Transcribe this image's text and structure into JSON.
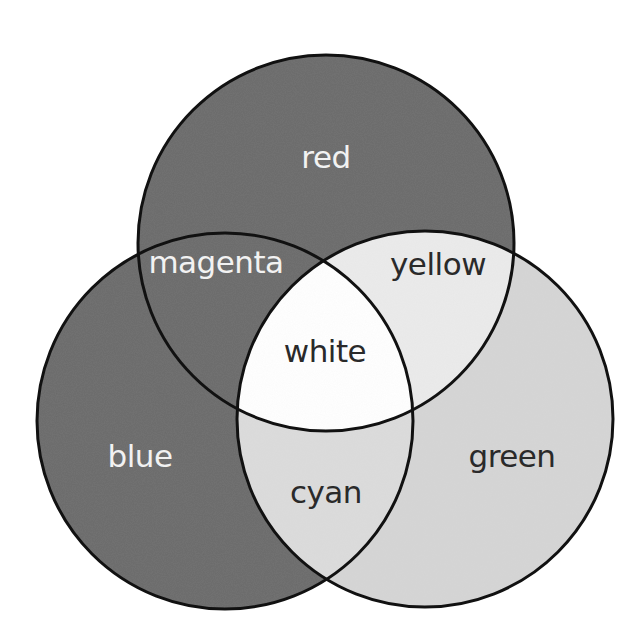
{
  "diagram": {
    "type": "venn",
    "title": "",
    "outline_color": "#111111",
    "sets": [
      {
        "id": "red",
        "label": "red",
        "cx": 326,
        "cy": 243,
        "r": 188,
        "fill": "#6b6b6b",
        "text_color": "#f2f2f2"
      },
      {
        "id": "blue",
        "label": "blue",
        "cx": 225,
        "cy": 421,
        "r": 188,
        "fill": "#6b6b6b",
        "text_color": "#f2f2f2"
      },
      {
        "id": "green",
        "label": "green",
        "cx": 425,
        "cy": 419,
        "r": 188,
        "fill": "#d5d5d5",
        "text_color": "#2a2a2a"
      }
    ],
    "regions": {
      "red": {
        "label": "red",
        "x": 326,
        "y": 168,
        "text_color": "#f2f2f2"
      },
      "blue": {
        "label": "blue",
        "x": 140,
        "y": 467,
        "text_color": "#f2f2f2"
      },
      "green": {
        "label": "green",
        "x": 512,
        "y": 467,
        "text_color": "#2a2a2a"
      },
      "magenta": {
        "label": "magenta",
        "x": 216,
        "y": 273,
        "text_color": "#f2f2f2",
        "fill": "#6b6b6b"
      },
      "yellow": {
        "label": "yellow",
        "x": 438,
        "y": 275,
        "text_color": "#2a2a2a",
        "fill": "#ebebeb"
      },
      "cyan": {
        "label": "cyan",
        "x": 326,
        "y": 503,
        "text_color": "#2a2a2a",
        "fill": "#dcdcdc"
      },
      "white": {
        "label": "white",
        "x": 325,
        "y": 362,
        "text_color": "#2a2a2a",
        "fill": "#ffffff"
      }
    }
  }
}
